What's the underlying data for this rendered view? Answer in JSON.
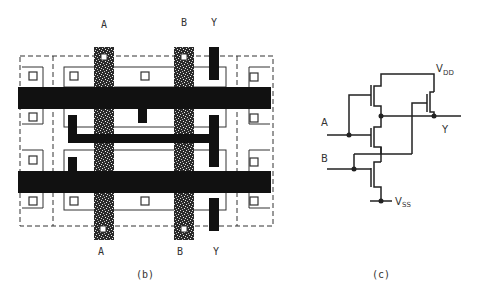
{
  "layout_figure": {
    "caption": "(b)",
    "top_labels": {
      "a": "A",
      "b": "B",
      "y": "Y"
    },
    "bottom_labels": {
      "a": "A",
      "b": "B",
      "y": "Y"
    }
  },
  "schematic_figure": {
    "caption": "(c)",
    "inputs": {
      "a": "A",
      "b": "B"
    },
    "output": "Y",
    "vdd": {
      "main": "V",
      "sub": "DD"
    },
    "vss": {
      "main": "V",
      "sub": "SS"
    }
  },
  "colors": {
    "metal": "#111111",
    "outline": "#333333",
    "background": "#ffffff"
  }
}
